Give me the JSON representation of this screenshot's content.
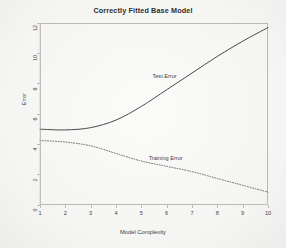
{
  "chart_data": {
    "type": "line",
    "title": "Correctly Fitted Base Model",
    "xlabel": "Model Complexity",
    "ylabel": "Error",
    "xlim": [
      1,
      10
    ],
    "ylim": [
      0,
      12
    ],
    "xticks": [
      1,
      2,
      3,
      4,
      5,
      6,
      7,
      8,
      9,
      10
    ],
    "yticks": [
      0,
      2,
      4,
      6,
      8,
      10,
      12
    ],
    "grid": false,
    "legend_position": "inline-annotation",
    "x": [
      1,
      2,
      3,
      4,
      5,
      6,
      7,
      8,
      9,
      10
    ],
    "series": [
      {
        "name": "Test Error",
        "style": "solid",
        "color": "#4a4a4a",
        "values": [
          5.0,
          4.95,
          5.1,
          5.6,
          6.5,
          7.6,
          8.7,
          9.8,
          10.8,
          11.7
        ],
        "annotation": "Test Error"
      },
      {
        "name": "Training Error",
        "style": "dotted",
        "color": "#5a5a5a",
        "values": [
          4.25,
          4.15,
          3.9,
          3.4,
          2.9,
          2.55,
          2.2,
          1.75,
          1.3,
          0.85
        ],
        "annotation": "Training Error"
      }
    ],
    "annotations": [
      {
        "text": "Test Error",
        "x": 6.15,
        "y": 8.45
      },
      {
        "text": "Training Error",
        "x": 6.0,
        "y": 3.05
      }
    ]
  },
  "colors": {
    "background": "#f7f7f5",
    "frame": "#b9b9b7",
    "text": "#3a3a3a",
    "test_error": "#4a4a4a",
    "training_error": "#5a5a5a"
  }
}
